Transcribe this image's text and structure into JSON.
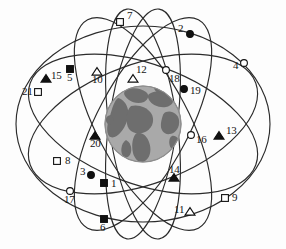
{
  "figure": {
    "width": 286,
    "height": 249,
    "background_color": "#fdfdfd",
    "orbit_line_color": "#2b2b2b",
    "earth": {
      "name": "earth-globe",
      "center_x": 143,
      "center_y": 124,
      "radius": 38,
      "ocean_color": "#a9a9a9",
      "land_color": "#6e6e6e",
      "edge_color": "#8d8d8d"
    },
    "marker_styles": {
      "filled_square": {
        "shape": "square",
        "fill": "#111111",
        "stroke": "#111111"
      },
      "open_square": {
        "shape": "square",
        "fill": "#ffffff",
        "stroke": "#111111"
      },
      "filled_circle": {
        "shape": "circle",
        "fill": "#111111",
        "stroke": "#111111"
      },
      "open_circle": {
        "shape": "circle",
        "fill": "#ffffff",
        "stroke": "#111111"
      },
      "filled_triangle": {
        "shape": "triangle",
        "fill": "#111111",
        "stroke": "#111111"
      },
      "open_triangle": {
        "shape": "triangle",
        "fill": "#ffffff",
        "stroke": "#111111"
      }
    },
    "orbits": [
      {
        "name": "orbit-outer-horizontal",
        "cx": 143,
        "cy": 124,
        "rx": 127,
        "ry": 98,
        "rotate": 0
      },
      {
        "name": "orbit-plane-a",
        "cx": 143,
        "cy": 124,
        "rx": 120,
        "ry": 60,
        "rotate": 20
      },
      {
        "name": "orbit-plane-b",
        "cx": 143,
        "cy": 124,
        "rx": 120,
        "ry": 60,
        "rotate": -20
      },
      {
        "name": "orbit-plane-c",
        "cx": 143,
        "cy": 124,
        "rx": 118,
        "ry": 46,
        "rotate": 62
      },
      {
        "name": "orbit-plane-d",
        "cx": 143,
        "cy": 124,
        "rx": 118,
        "ry": 46,
        "rotate": -62
      },
      {
        "name": "orbit-plane-e",
        "cx": 143,
        "cy": 124,
        "rx": 116,
        "ry": 34,
        "rotate": 82
      },
      {
        "name": "orbit-plane-f",
        "cx": 143,
        "cy": 124,
        "rx": 116,
        "ry": 34,
        "rotate": -82
      }
    ],
    "satellites": [
      {
        "id": "1",
        "label": "1",
        "marker": "filled_square",
        "x": 104,
        "y": 183,
        "label_x": 111,
        "label_y": 184
      },
      {
        "id": "2",
        "label": "2",
        "marker": "filled_circle",
        "x": 190,
        "y": 34,
        "label_x": 178,
        "label_y": 29
      },
      {
        "id": "3",
        "label": "3",
        "marker": "filled_circle",
        "x": 91,
        "y": 175,
        "label_x": 80,
        "label_y": 172
      },
      {
        "id": "4",
        "label": "4",
        "marker": "open_circle",
        "x": 244,
        "y": 63,
        "label_x": 233,
        "label_y": 66
      },
      {
        "id": "5",
        "label": "5",
        "marker": "filled_square",
        "x": 70,
        "y": 69,
        "label_x": 67,
        "label_y": 78
      },
      {
        "id": "6",
        "label": "6",
        "marker": "filled_square",
        "x": 104,
        "y": 219,
        "label_x": 100,
        "label_y": 228
      },
      {
        "id": "7",
        "label": "7",
        "marker": "open_square",
        "x": 120,
        "y": 22,
        "label_x": 127,
        "label_y": 16
      },
      {
        "id": "8",
        "label": "8",
        "marker": "open_square",
        "x": 57,
        "y": 161,
        "label_x": 65,
        "label_y": 161
      },
      {
        "id": "9",
        "label": "9",
        "marker": "open_square",
        "x": 225,
        "y": 198,
        "label_x": 232,
        "label_y": 198
      },
      {
        "id": "10",
        "label": "10",
        "marker": "open_triangle",
        "x": 97,
        "y": 72,
        "label_x": 92,
        "label_y": 80
      },
      {
        "id": "11",
        "label": "11",
        "marker": "open_triangle",
        "x": 190,
        "y": 212,
        "label_x": 174,
        "label_y": 210
      },
      {
        "id": "12",
        "label": "12",
        "marker": "open_triangle",
        "x": 133,
        "y": 79,
        "label_x": 136,
        "label_y": 70
      },
      {
        "id": "13",
        "label": "13",
        "marker": "filled_triangle",
        "x": 219,
        "y": 136,
        "label_x": 226,
        "label_y": 131
      },
      {
        "id": "14",
        "label": "14",
        "marker": "filled_triangle",
        "x": 174,
        "y": 178,
        "label_x": 169,
        "label_y": 170
      },
      {
        "id": "15",
        "label": "15",
        "marker": "filled_triangle",
        "x": 46,
        "y": 79,
        "label_x": 51,
        "label_y": 76
      },
      {
        "id": "16",
        "label": "16",
        "marker": "open_circle",
        "x": 191,
        "y": 135,
        "label_x": 196,
        "label_y": 140
      },
      {
        "id": "17",
        "label": "17",
        "marker": "open_circle",
        "x": 70,
        "y": 191,
        "label_x": 64,
        "label_y": 200
      },
      {
        "id": "18",
        "label": "18",
        "marker": "open_circle",
        "x": 166,
        "y": 70,
        "label_x": 169,
        "label_y": 79
      },
      {
        "id": "19",
        "label": "19",
        "marker": "filled_circle",
        "x": 184,
        "y": 89,
        "label_x": 190,
        "label_y": 91
      },
      {
        "id": "20",
        "label": "20",
        "marker": "filled_triangle",
        "x": 95,
        "y": 136,
        "label_x": 90,
        "label_y": 144
      },
      {
        "id": "21",
        "label": "21",
        "marker": "open_square",
        "x": 38,
        "y": 92,
        "label_x": 22,
        "label_y": 92
      }
    ]
  }
}
